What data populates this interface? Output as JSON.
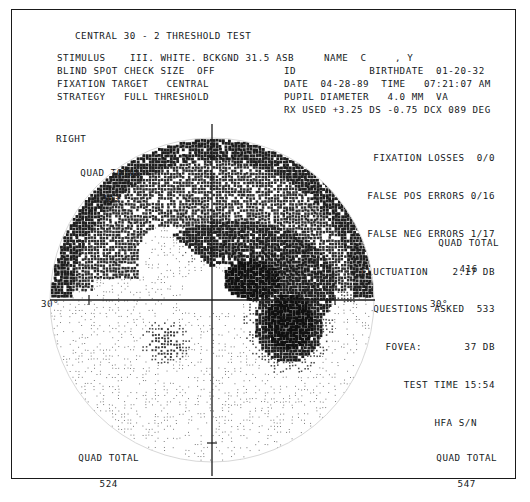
{
  "report": {
    "title": "CENTRAL 30 - 2 THRESHOLD TEST",
    "eye_label": "RIGHT",
    "params": {
      "stimulus_label": "STIMULUS",
      "stimulus_value": "III. WHITE. BCKGND 31.5 ASB",
      "blind_spot_label": "BLIND SPOT CHECK SIZE",
      "blind_spot_value": "OFF",
      "fixation_target_label": "FIXATION TARGET",
      "fixation_target_value": "CENTRAL",
      "strategy_label": "STRATEGY",
      "strategy_value": "FULL THRESHOLD"
    },
    "patient": {
      "name_label": "NAME",
      "name_value": "C",
      "name_second": ", Y",
      "id_label": "ID",
      "id_value": "",
      "birthdate_label": "BIRTHDATE",
      "birthdate_value": "01-20-32",
      "date_label": "DATE",
      "date_value": "04-28-89",
      "time_label": "TIME",
      "time_value": "07:21:07 AM",
      "pupil_label": "PUPIL DIAMETER",
      "pupil_value": "4.0 MM",
      "va_label": "VA",
      "va_value": "",
      "rx_label": "RX USED",
      "rx_value": "+3.25 DS -0.75 DCX 089 DEG"
    },
    "reliability": [
      {
        "label": "FIXATION LOSSES",
        "value": "0/0"
      },
      {
        "label": "FALSE POS ERRORS",
        "value": "0/16"
      },
      {
        "label": "FALSE NEG ERRORS",
        "value": "1/17"
      },
      {
        "label": "FLUCTUATION",
        "value": "2.17 DB"
      },
      {
        "label": "QUESTIONS ASKED",
        "value": "533"
      },
      {
        "label": "FOVEA:",
        "value": "37 DB"
      },
      {
        "label": "TEST TIME",
        "value": "15:54"
      },
      {
        "label": "HFA S/N",
        "value": ""
      }
    ],
    "quad_totals": {
      "label": "QUAD TOTAL",
      "top_left": "403",
      "top_right": "416",
      "bottom_left": "524",
      "bottom_right": "547"
    },
    "axes": {
      "left_degree": "30°",
      "right_degree": "30°"
    }
  },
  "chart_data": {
    "type": "heatmap",
    "xlabel": "horizontal meridian (degrees)",
    "ylabel": "vertical meridian (degrees)",
    "xlim": [
      -30,
      30
    ],
    "ylim": [
      -30,
      30
    ],
    "grid": false,
    "eye": "RIGHT",
    "legend": "HFA grayscale symbols: white = normal sensitivity, progressively darker stipple = reduced sensitivity, solid black = absolute defect",
    "gray_levels": [
      {
        "level": 0,
        "name": "white",
        "db_range": "35-40",
        "shade": "#ffffff"
      },
      {
        "level": 1,
        "name": "light-stipple",
        "db_range": "30-34",
        "shade": "#e3e3e3"
      },
      {
        "level": 2,
        "name": "stipple",
        "db_range": "25-29",
        "shade": "#c9c9c9"
      },
      {
        "level": 3,
        "name": "mid-gray",
        "db_range": "20-24",
        "shade": "#a8a8a8"
      },
      {
        "level": 4,
        "name": "dark-gray",
        "db_range": "15-19",
        "shade": "#7d7d7d"
      },
      {
        "level": 5,
        "name": "crosshatch",
        "db_range": "10-14",
        "shade": "#4f4f4f"
      },
      {
        "level": 6,
        "name": "dense-dark",
        "db_range": "5-9",
        "shade": "#2e2e2e"
      },
      {
        "level": 7,
        "name": "black",
        "db_range": "0-4",
        "shade": "#111111"
      }
    ],
    "features": [
      {
        "name": "superior-peripheral-depression",
        "shade_level": 5,
        "note": "dark crosshatch rim across superior and temporal periphery"
      },
      {
        "name": "superior-arcuate-scotoma",
        "shade_level": 6,
        "note": "dense arcuate defect arching from blind spot into superior nasal field"
      },
      {
        "name": "absolute-defect-core",
        "shade_level": 7,
        "note": "solid black core within the arcuate bundle"
      },
      {
        "name": "blind-spot",
        "shade_level": 7,
        "note": "physiologic blind spot just temporal to fixation, below horizontal meridian"
      },
      {
        "name": "inferior-island-defect",
        "shade_level": 4,
        "note": "small mid-gray island in inferior nasal field"
      },
      {
        "name": "central-field",
        "shade_level": 1,
        "note": "relatively preserved central and inferior field with light stipple"
      }
    ]
  }
}
